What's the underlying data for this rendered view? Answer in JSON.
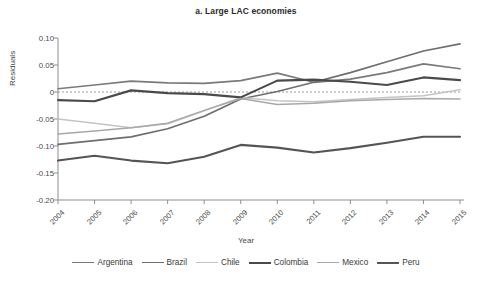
{
  "figure": {
    "title": "a. Large LAC economies",
    "background": "#ffffff"
  },
  "axes": {
    "ylabel": "Residuals",
    "xlabel": "Year",
    "ytick_labels": [
      "0.10",
      "0.05",
      "0",
      "-0.05",
      "-0.10",
      "-0.15",
      "-0.20"
    ],
    "xtick_labels": [
      "2004",
      "2005",
      "2006",
      "2007",
      "2008",
      "2009",
      "2010",
      "2011",
      "2012",
      "2013",
      "2014",
      "2015"
    ],
    "zero_line_color": "#9a9a9a",
    "axis_color": "#8d8d8d"
  },
  "legend": {
    "position": "bottom",
    "entries": [
      {
        "label": "Argentina",
        "color": "#7a7a7a",
        "width": 1.7
      },
      {
        "label": "Brazil",
        "color": "#6e6e6e",
        "width": 1.7
      },
      {
        "label": "Chile",
        "color": "#c4c4c4",
        "width": 1.5
      },
      {
        "label": "Colombia",
        "color": "#4a4a4a",
        "width": 2.1
      },
      {
        "label": "Mexico",
        "color": "#a8a8a8",
        "width": 1.5
      },
      {
        "label": "Peru",
        "color": "#555555",
        "width": 2.1
      }
    ]
  },
  "chart_data": {
    "type": "line",
    "title": "a. Large LAC economies",
    "xlabel": "Year",
    "ylabel": "Residuals",
    "x": [
      2004,
      2005,
      2006,
      2007,
      2008,
      2009,
      2010,
      2011,
      2012,
      2013,
      2014,
      2015
    ],
    "xlim": [
      2004,
      2015
    ],
    "ylim": [
      -0.2,
      0.1
    ],
    "yticks": [
      0.1,
      0.05,
      0,
      -0.05,
      -0.1,
      -0.15,
      -0.2
    ],
    "grid": false,
    "reference_line": 0,
    "legend_position": "bottom",
    "series": [
      {
        "name": "Argentina",
        "color": "#7a7a7a",
        "values": [
          0.006,
          0.013,
          0.02,
          0.017,
          0.016,
          0.021,
          0.035,
          0.018,
          0.024,
          0.036,
          0.052,
          0.043
        ]
      },
      {
        "name": "Brazil",
        "color": "#6e6e6e",
        "values": [
          -0.097,
          -0.09,
          -0.083,
          -0.068,
          -0.045,
          -0.013,
          0.001,
          0.018,
          0.036,
          0.056,
          0.076,
          0.089
        ]
      },
      {
        "name": "Chile",
        "color": "#c4c4c4",
        "values": [
          -0.05,
          -0.058,
          -0.066,
          -0.059,
          -0.035,
          -0.01,
          -0.016,
          -0.018,
          -0.014,
          -0.01,
          -0.007,
          0.004
        ]
      },
      {
        "name": "Colombia",
        "color": "#4a4a4a",
        "values": [
          -0.015,
          -0.017,
          0.003,
          -0.002,
          -0.004,
          -0.01,
          0.021,
          0.023,
          0.019,
          0.013,
          0.027,
          0.022
        ]
      },
      {
        "name": "Mexico",
        "color": "#a8a8a8",
        "values": [
          -0.078,
          -0.072,
          -0.066,
          -0.058,
          -0.034,
          -0.012,
          -0.023,
          -0.021,
          -0.016,
          -0.014,
          -0.012,
          -0.013
        ]
      },
      {
        "name": "Peru",
        "color": "#555555",
        "values": [
          -0.127,
          -0.118,
          -0.127,
          -0.132,
          -0.12,
          -0.098,
          -0.103,
          -0.112,
          -0.104,
          -0.094,
          -0.083,
          -0.083
        ]
      }
    ]
  }
}
